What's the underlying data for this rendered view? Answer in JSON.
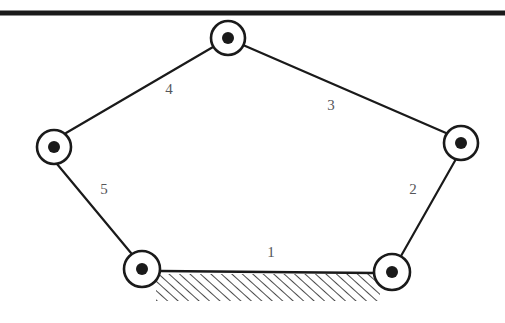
{
  "figure": {
    "kind": "kinematic-linkage-diagram",
    "background_color": "#ffffff",
    "line_color": "#1a1a1a",
    "label_color": "#55565a",
    "ground_bar": {
      "name": "upper-ground-bar",
      "x1": 0,
      "y1": 13,
      "x2": 505,
      "y2": 13,
      "thickness": 5
    },
    "joints": [
      {
        "id": "joint-top",
        "name": "revolute-joint-top",
        "cx": 228,
        "cy": 38,
        "r_outer": 17,
        "r_inner": 6
      },
      {
        "id": "joint-left",
        "name": "revolute-joint-left",
        "cx": 54,
        "cy": 147,
        "r_outer": 17,
        "r_inner": 6
      },
      {
        "id": "joint-right",
        "name": "revolute-joint-right",
        "cx": 461,
        "cy": 143,
        "r_outer": 17,
        "r_inner": 6
      },
      {
        "id": "joint-bottom-left",
        "name": "revolute-joint-bottom-left",
        "cx": 142,
        "cy": 269,
        "r_outer": 18,
        "r_inner": 6
      },
      {
        "id": "joint-bottom-right",
        "name": "revolute-joint-bottom-right",
        "cx": 392,
        "cy": 272,
        "r_outer": 18,
        "r_inner": 6
      }
    ],
    "links": [
      {
        "id": "link-1",
        "label": "1",
        "from": "joint-bottom-left",
        "to": "joint-bottom-right",
        "x1": 160,
        "y1": 271,
        "x2": 375,
        "y2": 273,
        "label_x": 271,
        "label_y": 257,
        "fixed": true
      },
      {
        "id": "link-2",
        "label": "2",
        "from": "joint-bottom-right",
        "to": "joint-right",
        "x1": 401,
        "y1": 256,
        "x2": 456,
        "y2": 159,
        "label_x": 413,
        "label_y": 194,
        "fixed": false
      },
      {
        "id": "link-3",
        "label": "3",
        "from": "joint-right",
        "to": "joint-top",
        "x1": 446,
        "y1": 133,
        "x2": 243,
        "y2": 45,
        "label_x": 331,
        "label_y": 110,
        "fixed": false
      },
      {
        "id": "link-4",
        "label": "4",
        "from": "joint-top",
        "to": "joint-left",
        "x1": 213,
        "y1": 47,
        "x2": 66,
        "y2": 133,
        "label_x": 169,
        "label_y": 94,
        "fixed": false
      },
      {
        "id": "link-5",
        "label": "5",
        "from": "joint-left",
        "to": "joint-bottom-left",
        "x1": 57,
        "y1": 164,
        "x2": 131,
        "y2": 253,
        "label_x": 104,
        "label_y": 194,
        "fixed": false
      }
    ],
    "ground_hatching": {
      "name": "ground-hatching",
      "x": 156,
      "y": 274,
      "width": 224,
      "height": 27,
      "stroke_width": 1.6,
      "spacing": 7,
      "angle_note": "lines slant up to the right"
    }
  }
}
